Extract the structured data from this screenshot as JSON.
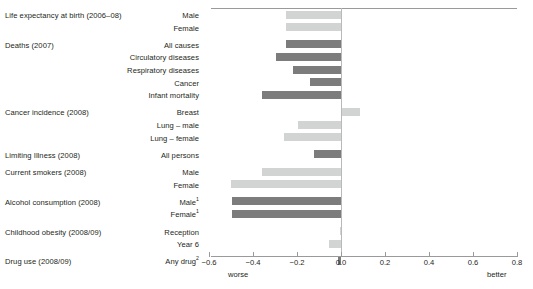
{
  "chart_data": {
    "type": "bar",
    "orientation": "horizontal",
    "title": "",
    "xlabel": "",
    "ylabel": "",
    "xlim": [
      -0.6,
      0.8
    ],
    "xticks": [
      "−0.6",
      "−0.4",
      "−0.2",
      "0.0",
      "0.2",
      "0.4",
      "0.6",
      "0.8"
    ],
    "xtick_values": [
      -0.6,
      -0.4,
      -0.2,
      0.0,
      0.2,
      0.4,
      0.6,
      0.8
    ],
    "grid": false,
    "legend": "none",
    "axis_endpoint_labels": {
      "left": "worse",
      "right": "better"
    },
    "zero_reference_line": true,
    "colors": {
      "light": "#d2d4d3",
      "dark": "#7c7c7c",
      "axis": "#9a9a9a",
      "zero": "#b9b9b9",
      "text": "#231f20"
    },
    "groups": [
      {
        "group": "Life expectancy at birth (2006–08)",
        "items": [
          {
            "label": "Male",
            "value": -0.25,
            "shade": "light"
          },
          {
            "label": "Female",
            "value": -0.25,
            "shade": "light"
          }
        ]
      },
      {
        "group": "Deaths (2007)",
        "items": [
          {
            "label": "All causes",
            "value": -0.25,
            "shade": "dark"
          },
          {
            "label": "Circulatory diseases",
            "value": -0.295,
            "shade": "dark"
          },
          {
            "label": "Respiratory diseases",
            "value": -0.22,
            "shade": "dark"
          },
          {
            "label": "Cancer",
            "value": -0.14,
            "shade": "dark"
          },
          {
            "label": "Infant mortality",
            "value": -0.36,
            "shade": "dark"
          }
        ]
      },
      {
        "group": "Cancer incidence (2008)",
        "items": [
          {
            "label": "Breast",
            "value": 0.08,
            "shade": "light"
          },
          {
            "label": "Lung – male",
            "value": -0.195,
            "shade": "light"
          },
          {
            "label": "Lung – female",
            "value": -0.26,
            "shade": "light"
          }
        ]
      },
      {
        "group": "Limiting Illness (2008)",
        "items": [
          {
            "label": "All persons",
            "value": -0.125,
            "shade": "dark"
          }
        ]
      },
      {
        "group": "Current smokers (2008)",
        "items": [
          {
            "label": "Male",
            "value": -0.36,
            "shade": "light"
          },
          {
            "label": "Female",
            "value": -0.5,
            "shade": "light"
          }
        ]
      },
      {
        "group": "Alcohol consumption (2008)",
        "items": [
          {
            "label": "Male¹",
            "value": -0.495,
            "shade": "dark"
          },
          {
            "label": "Female¹",
            "value": -0.495,
            "shade": "dark"
          }
        ]
      },
      {
        "group": "Childhood obesity (2008/09)",
        "items": [
          {
            "label": "Reception",
            "value": -0.005,
            "shade": "light"
          },
          {
            "label": "Year 6",
            "value": -0.055,
            "shade": "light"
          }
        ]
      },
      {
        "group": "Drug use (2008/09)",
        "items": [
          {
            "label": "Any drug²",
            "value": -0.012,
            "shade": "dark"
          }
        ]
      }
    ]
  }
}
